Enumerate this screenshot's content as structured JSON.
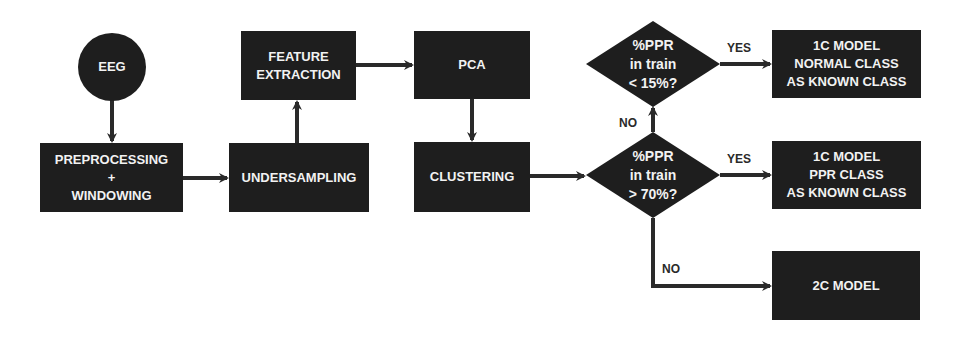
{
  "nodes": {
    "eeg": "EEG",
    "preprocessing": "PREPROCESSING\n+\nWINDOWING",
    "undersampling": "UNDERSAMPLING",
    "feature_extraction": "FEATURE\nEXTRACTION",
    "pca": "PCA",
    "clustering": "CLUSTERING",
    "decision_low": "%PPR\nin train\n< 15%?",
    "decision_high": "%PPR\nin train\n> 70%?",
    "model_normal": "1C MODEL\nNORMAL CLASS\nAS KNOWN CLASS",
    "model_ppr": "1C MODEL\nPPR CLASS\nAS KNOWN CLASS",
    "model_2c": "2C MODEL"
  },
  "edge_labels": {
    "yes_low": "YES",
    "yes_high": "YES",
    "no_up": "NO",
    "no_down": "NO"
  },
  "colors": {
    "node_fill": "#1e1e1e",
    "node_text": "#f2f2f2",
    "edge": "#2a2a2a",
    "background": "#ffffff"
  }
}
